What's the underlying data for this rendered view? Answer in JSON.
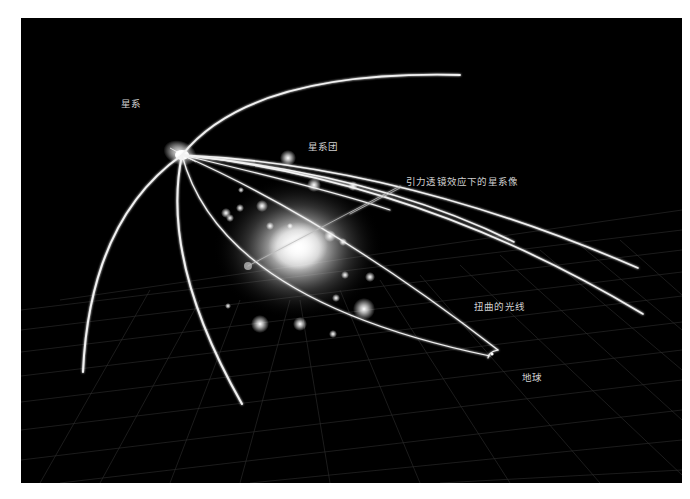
{
  "diagram": {
    "title": "",
    "background_color": "#000000",
    "line_color": "#ffffff",
    "labels": {
      "galaxy": "星系",
      "galaxy_cluster": "星系团",
      "lensed_images": "引力透镜效应下的星系像",
      "distorted_light": "扭曲的光线",
      "earth": "地球"
    }
  }
}
